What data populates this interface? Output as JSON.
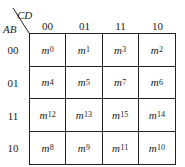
{
  "kmap": {
    "row_variables": "AB",
    "col_variables": "CD",
    "col_headers": [
      "00",
      "01",
      "11",
      "10"
    ],
    "row_headers": [
      "00",
      "01",
      "11",
      "10"
    ],
    "cells": [
      [
        {
          "m": "m",
          "i": "0"
        },
        {
          "m": "m",
          "i": "1"
        },
        {
          "m": "m",
          "i": "3"
        },
        {
          "m": "m",
          "i": "2"
        }
      ],
      [
        {
          "m": "m",
          "i": "4"
        },
        {
          "m": "m",
          "i": "5"
        },
        {
          "m": "m",
          "i": "7"
        },
        {
          "m": "m",
          "i": "6"
        }
      ],
      [
        {
          "m": "m",
          "i": "12"
        },
        {
          "m": "m",
          "i": "13"
        },
        {
          "m": "m",
          "i": "15"
        },
        {
          "m": "m",
          "i": "14"
        }
      ],
      [
        {
          "m": "m",
          "i": "8"
        },
        {
          "m": "m",
          "i": "9"
        },
        {
          "m": "m",
          "i": "11"
        },
        {
          "m": "m",
          "i": "10"
        }
      ]
    ]
  }
}
